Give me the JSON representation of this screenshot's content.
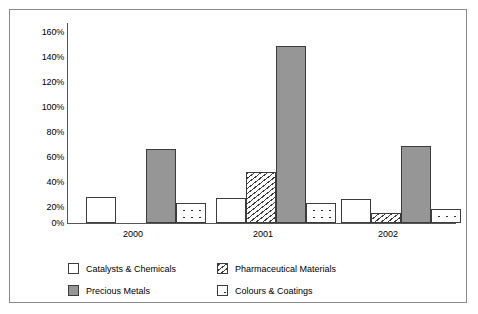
{
  "chart_data": {
    "type": "bar",
    "title": "",
    "subtitle": "",
    "xlabel": "",
    "ylabel": "",
    "categories": [
      "2000",
      "2001",
      "2002"
    ],
    "ylim": [
      0,
      160
    ],
    "ytick_values": [
      0,
      20,
      40,
      60,
      80,
      100,
      120,
      140,
      160
    ],
    "ytick_labels": [
      "0%",
      "20%",
      "40%",
      "60%",
      "80%",
      "100%",
      "120%",
      "140%",
      "160%"
    ],
    "grid": false,
    "legend_position": "bottom",
    "series": [
      {
        "name": "Catalysts & Chemicals",
        "pattern": "solid-white",
        "color": "#ffffff",
        "values": [
          21,
          20,
          19
        ]
      },
      {
        "name": "Pharmaceutical Materials",
        "pattern": "hatch-diagonal",
        "color": "#ffffff",
        "values": [
          0,
          41,
          8
        ]
      },
      {
        "name": "Precious Metals",
        "pattern": "solid-gray",
        "color": "#969696",
        "values": [
          59,
          142,
          62
        ]
      },
      {
        "name": "Colours & Coatings",
        "pattern": "dots",
        "color": "#ffffff",
        "values": [
          16,
          16,
          11
        ]
      }
    ]
  },
  "axis": {
    "ticks": [
      "160%",
      "140%",
      "120%",
      "100%",
      "80%",
      "60%",
      "40%",
      "20%",
      "0%"
    ]
  },
  "legend": {
    "items": [
      {
        "label": "Catalysts & Chemicals",
        "pattern": "solid-white"
      },
      {
        "label": "Pharmaceutical Materials",
        "pattern": "hatch-diagonal"
      },
      {
        "label": "Precious Metals",
        "pattern": "solid-gray"
      },
      {
        "label": "Colours & Coatings",
        "pattern": "dots"
      }
    ]
  }
}
